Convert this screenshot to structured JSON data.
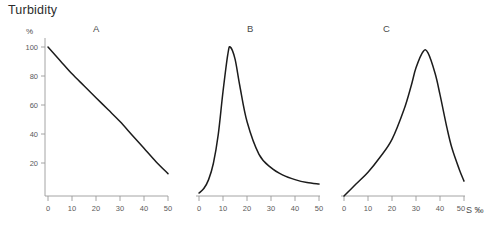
{
  "figure": {
    "title": "Turbidity",
    "y_unit": "%",
    "x_unit_label": "S ‰"
  },
  "panels": [
    {
      "id": "A",
      "label": "A"
    },
    {
      "id": "B",
      "label": "B"
    },
    {
      "id": "C",
      "label": "C"
    }
  ],
  "axis": {
    "y_ticks": [
      "100",
      "80",
      "60",
      "40",
      "20"
    ],
    "x_ticks": [
      "0",
      "10",
      "20",
      "30",
      "40",
      "50"
    ]
  },
  "chart_data": {
    "type": "line",
    "title": "Turbidity",
    "xlabel": "S ‰",
    "ylabel": "Turbidity",
    "ylim": [
      0,
      110
    ],
    "xlim": [
      0,
      50
    ],
    "grid": false,
    "legend": "none",
    "panel_count": 3,
    "panels": [
      {
        "label": "A",
        "description": "Monotonic convex decay of turbidity with increasing salinity",
        "x": [
          0,
          5,
          10,
          15,
          20,
          25,
          30,
          35,
          40,
          45,
          50
        ],
        "y": [
          100,
          91,
          82,
          74,
          66,
          58,
          50,
          41,
          32,
          23,
          15
        ],
        "peak_x": 0,
        "peak_y": 100
      },
      {
        "label": "B",
        "description": "Sharp asymmetric peak at low salinity with long right tail",
        "x": [
          0,
          2,
          4,
          6,
          8,
          10,
          12,
          13,
          15,
          17,
          20,
          25,
          30,
          35,
          40,
          45,
          50
        ],
        "y": [
          2,
          5,
          11,
          22,
          41,
          70,
          95,
          100,
          92,
          74,
          50,
          28,
          19,
          14,
          11,
          9,
          8
        ],
        "peak_x": 13,
        "peak_y": 100
      },
      {
        "label": "C",
        "description": "Broad rounded peak at mid-high salinity, gradual rise and steeper fall",
        "x": [
          0,
          5,
          10,
          15,
          20,
          25,
          28,
          30,
          33,
          35,
          38,
          40,
          43,
          45,
          48,
          50
        ],
        "y": [
          0,
          8,
          16,
          26,
          38,
          58,
          74,
          86,
          97,
          96,
          82,
          68,
          45,
          32,
          18,
          10
        ],
        "peak_x": 33,
        "peak_y": 97
      }
    ]
  }
}
